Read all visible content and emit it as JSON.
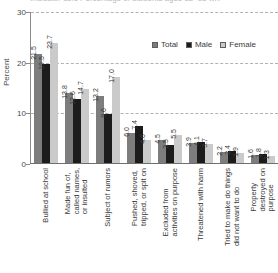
{
  "title_clip": "Indicator 11.1 Percentage of students ages 12–18 who reported being bullied at school",
  "axis": {
    "y_title": "Percent",
    "y_ticks": [
      "30",
      "20",
      "10",
      "0"
    ],
    "y_min": 0,
    "y_max": 30
  },
  "legend": {
    "position": "top-right",
    "items": [
      {
        "label": "Total",
        "color": "#7d7d7d"
      },
      {
        "label": "Male",
        "color": "#1c1c1c"
      },
      {
        "label": "Female",
        "color": "#cacaca"
      }
    ]
  },
  "chart_data": {
    "type": "bar",
    "title": "",
    "xlabel": "",
    "ylabel": "Percent",
    "ylim": [
      0,
      30
    ],
    "grid": true,
    "legend_position": "top-right",
    "categories": [
      "Bullied at school",
      "Made fun of,\ncalled names,\nor insulted",
      "Subject of rumors",
      "Pushed, shoved,\ntripped, or spit on",
      "Excluded from\nactivities on purpose",
      "Threatened with harm",
      "Tried to make do things\ndid not want to do",
      "Property\ndestroyed on\npurpose"
    ],
    "series": [
      {
        "name": "Total",
        "color": "#7d7d7d",
        "values": [
          21.5,
          13.8,
          13.2,
          6.0,
          4.5,
          3.9,
          2.2,
          1.6
        ]
      },
      {
        "name": "Male",
        "color": "#1c1c1c",
        "values": [
          19.5,
          12.6,
          9.6,
          7.4,
          3.5,
          4.1,
          2.4,
          1.8
        ]
      },
      {
        "name": "Female",
        "color": "#cacaca",
        "values": [
          23.7,
          14.7,
          17.0,
          4.6,
          5.5,
          3.7,
          1.9,
          1.3
        ]
      }
    ]
  }
}
